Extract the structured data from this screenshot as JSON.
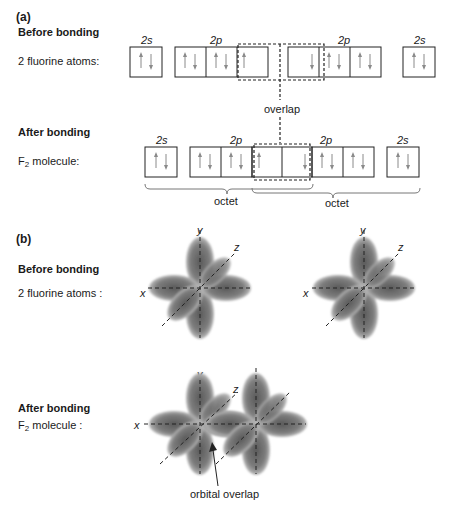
{
  "part_a": {
    "label": "(a)",
    "before": {
      "heading": "Before bonding",
      "row_label": "2 fluorine atoms:",
      "orbital_labels": [
        "2s",
        "2p",
        "2p",
        "2s"
      ]
    },
    "overlap_label": "overlap",
    "after": {
      "heading": "After bonding",
      "row_label_prefix": "F",
      "row_label_sub": "2",
      "row_label_suffix": " molecule:",
      "orbital_labels": [
        "2s",
        "2p",
        "2p",
        "2s"
      ]
    },
    "brace_labels": [
      "octet",
      "octet"
    ]
  },
  "part_b": {
    "label": "(b)",
    "before": {
      "heading": "Before bonding",
      "row_label": "2 fluorine atoms :"
    },
    "after": {
      "heading": "After bonding",
      "row_label_prefix": "F",
      "row_label_sub": "2",
      "row_label_suffix": " molecule :"
    },
    "axis_labels": {
      "x": "x",
      "y": "y",
      "z": "z"
    },
    "annotation": "orbital overlap"
  }
}
